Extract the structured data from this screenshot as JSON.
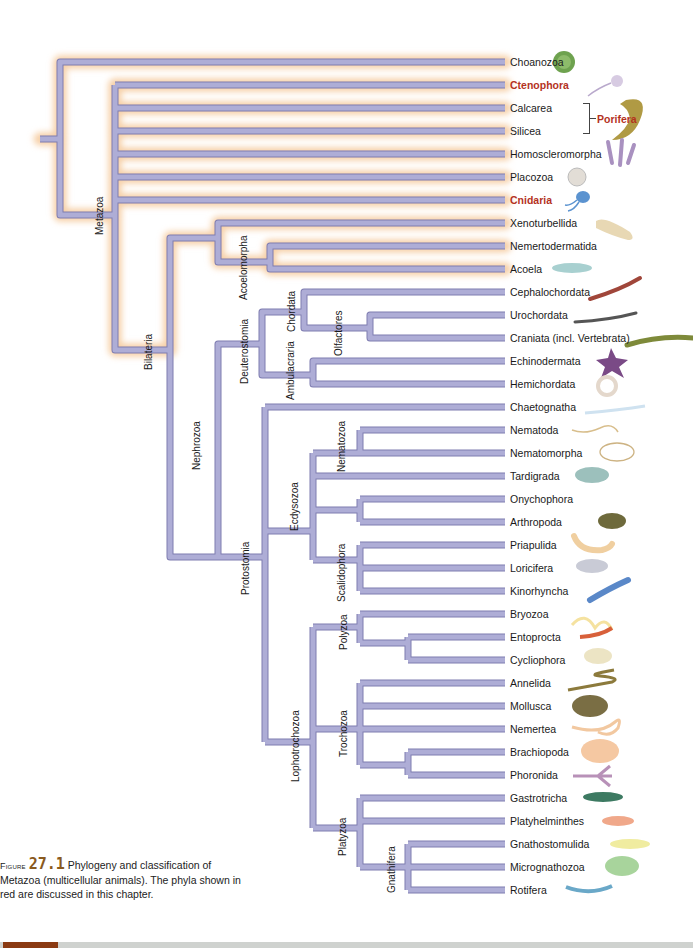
{
  "figure": {
    "number_label": "Figure",
    "number": "27.1",
    "caption": "Phylogeny and classification of Metazoa (multicellular animals). The phyla shown in red are discussed in this chapter."
  },
  "colors": {
    "branch": "#a7a6cf",
    "branch_edge": "#7e7cb0",
    "glow": "#f6cfa6",
    "red_phylum": "#b4321e",
    "figure_number": "#8a5a1e"
  },
  "taxa": [
    {
      "name": "Choanozoa",
      "y": 62,
      "highlight": false
    },
    {
      "name": "Ctenophora",
      "y": 85,
      "highlight": true
    },
    {
      "name": "Calcarea",
      "y": 108,
      "highlight": false
    },
    {
      "name": "Silicea",
      "y": 131,
      "highlight": false
    },
    {
      "name": "Homoscleromorpha",
      "y": 154,
      "highlight": false
    },
    {
      "name": "Placozoa",
      "y": 177,
      "highlight": false
    },
    {
      "name": "Cnidaria",
      "y": 200,
      "highlight": true
    },
    {
      "name": "Xenoturbellida",
      "y": 223,
      "highlight": false
    },
    {
      "name": "Nemertodermatida",
      "y": 246,
      "highlight": false
    },
    {
      "name": "Acoela",
      "y": 269,
      "highlight": false
    },
    {
      "name": "Cephalochordata",
      "y": 292,
      "highlight": false
    },
    {
      "name": "Urochordata",
      "y": 315,
      "highlight": false
    },
    {
      "name": "Craniata (incl. Vertebrata)",
      "y": 338,
      "highlight": false
    },
    {
      "name": "Echinodermata",
      "y": 361,
      "highlight": false
    },
    {
      "name": "Hemichordata",
      "y": 384,
      "highlight": false
    },
    {
      "name": "Chaetognatha",
      "y": 407,
      "highlight": false
    },
    {
      "name": "Nematoda",
      "y": 430,
      "highlight": false
    },
    {
      "name": "Nematomorpha",
      "y": 453,
      "highlight": false
    },
    {
      "name": "Tardigrada",
      "y": 476,
      "highlight": false
    },
    {
      "name": "Onychophora",
      "y": 499,
      "highlight": false
    },
    {
      "name": "Arthropoda",
      "y": 522,
      "highlight": false
    },
    {
      "name": "Priapulida",
      "y": 545,
      "highlight": false
    },
    {
      "name": "Loricifera",
      "y": 568,
      "highlight": false
    },
    {
      "name": "Kinorhyncha",
      "y": 591,
      "highlight": false
    },
    {
      "name": "Bryozoa",
      "y": 614,
      "highlight": false
    },
    {
      "name": "Entoprocta",
      "y": 637,
      "highlight": false
    },
    {
      "name": "Cycliophora",
      "y": 660,
      "highlight": false
    },
    {
      "name": "Annelida",
      "y": 683,
      "highlight": false
    },
    {
      "name": "Mollusca",
      "y": 706,
      "highlight": false
    },
    {
      "name": "Nemertea",
      "y": 729,
      "highlight": false
    },
    {
      "name": "Brachiopoda",
      "y": 752,
      "highlight": false
    },
    {
      "name": "Phoronida",
      "y": 775,
      "highlight": false
    },
    {
      "name": "Gastrotricha",
      "y": 798,
      "highlight": false
    },
    {
      "name": "Platyhelminthes",
      "y": 821,
      "highlight": false
    },
    {
      "name": "Gnathostomulida",
      "y": 844,
      "highlight": false
    },
    {
      "name": "Micrognathozoa",
      "y": 867,
      "highlight": false
    },
    {
      "name": "Rotifera",
      "y": 890,
      "highlight": false
    }
  ],
  "grouping": {
    "porifera": {
      "label": "Porifera",
      "members": [
        "Calcarea",
        "Silicea"
      ]
    }
  },
  "clades": [
    {
      "name": "Metazoa",
      "x": 94,
      "y": 235
    },
    {
      "name": "Bilateria",
      "x": 143,
      "y": 370
    },
    {
      "name": "Acoelomorpha",
      "x": 238,
      "y": 300
    },
    {
      "name": "Nephrozoa",
      "x": 191,
      "y": 470
    },
    {
      "name": "Deuterostomia",
      "x": 239,
      "y": 384
    },
    {
      "name": "Chordata",
      "x": 286,
      "y": 332
    },
    {
      "name": "Olfactores",
      "x": 333,
      "y": 356
    },
    {
      "name": "Ambulacraria",
      "x": 285,
      "y": 400
    },
    {
      "name": "Protostomia",
      "x": 240,
      "y": 595
    },
    {
      "name": "Nematozoa",
      "x": 336,
      "y": 472
    },
    {
      "name": "Ecdysozoa",
      "x": 289,
      "y": 531
    },
    {
      "name": "Scalidophora",
      "x": 336,
      "y": 602
    },
    {
      "name": "Polyzoa",
      "x": 338,
      "y": 650
    },
    {
      "name": "Lophotrochozoa",
      "x": 290,
      "y": 782
    },
    {
      "name": "Trochozoa",
      "x": 338,
      "y": 757
    },
    {
      "name": "Platyzoa",
      "x": 337,
      "y": 856
    },
    {
      "name": "Gnathifera",
      "x": 386,
      "y": 893
    }
  ],
  "tree_paths": {
    "glow": [
      "M40 139 H60 M60 139 V62 Q60 62 65 62 H505",
      "M60 139 V215 H115",
      "M115 85 V350 H170",
      "M115 85 H505 M115 108 H505 M115 131 H505 M115 154 H505 M115 177 H505 M115 200 H505",
      "M170 350 V238 H218 M218 238 V223 H505 M218 238 V262 H270 M270 262 V246 H505 M270 262 V269 H505"
    ],
    "plain": [
      "M170 350 V557 H218",
      "M218 557 V344 H262 M262 344 V312 H304 M262 344 V375 H313",
      "M304 312 V292 H505 M304 312 V328 H370 M370 328 V315 H505 M370 328 V338 H505",
      "M313 375 V361 H505 M313 375 V384 H505",
      "M218 557 H265 M265 407 V742",
      "M265 407 H505",
      "M265 531 H313 M313 453 V560",
      "M313 453 H360 M360 430 V453 M360 430 H505 M360 453 H505",
      "M313 476 H505",
      "M313 510 H360 M360 499 V522 M360 499 H505 M360 522 H505",
      "M313 560 H360 M360 545 V591 M360 545 H505 M360 568 H505 M360 591 H505",
      "M265 742 H313 M313 627 V828",
      "M313 627 H360 M360 614 V643 M360 614 H505 M360 643 H408 M408 637 V660 M408 637 H505 M408 660 H505",
      "M313 729 H360 M360 683 V765 M360 683 H505 M360 706 H505 M360 729 H505 M360 765 H408 M408 752 V775 M408 752 H505 M408 775 H505",
      "M313 828 H360 M360 798 V867 M360 798 H505 M360 821 H505 M360 867 H408 M408 844 V890 M408 844 H505 M408 867 H505 M408 890 H505"
    ]
  },
  "animals": [
    {
      "name": "choanozoa-illustration",
      "x": 550,
      "y": 47,
      "color": "#5f9a4a"
    },
    {
      "name": "ctenophora-illustration",
      "x": 600,
      "y": 70,
      "color": "#c9bcd6"
    },
    {
      "name": "porifera-illustration",
      "x": 610,
      "y": 105,
      "color": "#a5923a"
    },
    {
      "name": "homoscleromorpha-illustration",
      "x": 612,
      "y": 145,
      "color": "#a993bd"
    },
    {
      "name": "placozoa-illustration",
      "x": 568,
      "y": 168,
      "color": "#d9d4cc"
    },
    {
      "name": "cnidaria-illustration",
      "x": 572,
      "y": 193,
      "color": "#4e88c9"
    }
  ]
}
